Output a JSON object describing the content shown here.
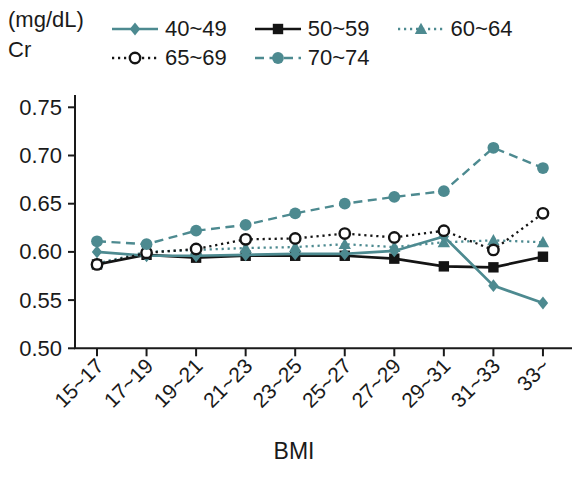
{
  "chart_data": {
    "type": "line",
    "title": "",
    "xlabel": "BMI",
    "ylabel": "Cr",
    "y_unit": "(mg/dL)",
    "ylim": [
      0.5,
      0.75
    ],
    "ytick_step": 0.05,
    "grid": false,
    "legend_position": "top",
    "categories": [
      "15~17",
      "17~19",
      "19~21",
      "21~23",
      "23~25",
      "25~27",
      "27~29",
      "29~31",
      "31~33",
      "33~"
    ],
    "series": [
      {
        "name": "40~49",
        "color": "#4d8a90",
        "line": "solid",
        "marker": "diamond",
        "values": [
          0.6,
          0.596,
          0.596,
          0.597,
          0.598,
          0.598,
          0.601,
          0.616,
          0.565,
          0.547
        ]
      },
      {
        "name": "50~59",
        "color": "#141414",
        "line": "solid",
        "marker": "square",
        "values": [
          0.587,
          0.597,
          0.594,
          0.596,
          0.596,
          0.596,
          0.593,
          0.585,
          0.584,
          0.595
        ]
      },
      {
        "name": "60~64",
        "color": "#4d8a90",
        "line": "dotted",
        "marker": "triangle",
        "values": [
          0.588,
          0.6,
          0.602,
          0.604,
          0.605,
          0.608,
          0.605,
          0.61,
          0.612,
          0.61
        ]
      },
      {
        "name": "65~69",
        "color": "#141414",
        "line": "dotted",
        "marker": "circle-open",
        "values": [
          0.587,
          0.599,
          0.603,
          0.613,
          0.614,
          0.619,
          0.615,
          0.622,
          0.602,
          0.64
        ]
      },
      {
        "name": "70~74",
        "color": "#4d8a90",
        "line": "dashed",
        "marker": "circle",
        "values": [
          0.611,
          0.608,
          0.622,
          0.628,
          0.64,
          0.65,
          0.657,
          0.663,
          0.708,
          0.687
        ]
      }
    ]
  }
}
